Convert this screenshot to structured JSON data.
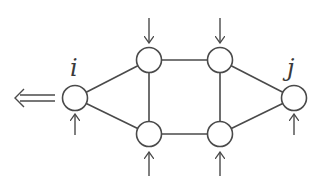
{
  "diagram": {
    "type": "network-graph",
    "colors": {
      "stroke": "#4a4a4a",
      "node_fill": "#ffffff",
      "background": "#ffffff"
    },
    "nodes": [
      {
        "id": "i",
        "label": "i",
        "x": 75,
        "y": 98
      },
      {
        "id": "tl",
        "label": "",
        "x": 149,
        "y": 60
      },
      {
        "id": "tr",
        "label": "",
        "x": 220,
        "y": 60
      },
      {
        "id": "bl",
        "label": "",
        "x": 149,
        "y": 134
      },
      {
        "id": "br",
        "label": "",
        "x": 220,
        "y": 134
      },
      {
        "id": "j",
        "label": "j",
        "x": 294,
        "y": 98
      }
    ],
    "edges": [
      [
        "i",
        "tl"
      ],
      [
        "i",
        "bl"
      ],
      [
        "tl",
        "tr"
      ],
      [
        "tl",
        "bl"
      ],
      [
        "tr",
        "br"
      ],
      [
        "bl",
        "br"
      ],
      [
        "tr",
        "j"
      ],
      [
        "br",
        "j"
      ]
    ],
    "labels": {
      "i": "i",
      "j": "j"
    },
    "inputs": [
      {
        "node": "i",
        "direction": "up"
      },
      {
        "node": "tl",
        "direction": "down"
      },
      {
        "node": "tr",
        "direction": "down"
      },
      {
        "node": "bl",
        "direction": "up"
      },
      {
        "node": "br",
        "direction": "up"
      },
      {
        "node": "j",
        "direction": "up"
      }
    ],
    "output": {
      "node": "i",
      "direction": "left",
      "style": "double-arrow"
    }
  }
}
